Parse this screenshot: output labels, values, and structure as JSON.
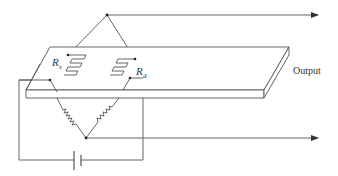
{
  "diagram": {
    "labels": {
      "rs_main": "R",
      "rs_sub": "s",
      "rd_main": "R",
      "rd_sub": "d",
      "output": "Output"
    },
    "components": [
      {
        "id": "Rs",
        "type": "strain-gauge",
        "label": "Rs"
      },
      {
        "id": "Rd",
        "type": "strain-gauge",
        "label": "Rd"
      },
      {
        "id": "R1",
        "type": "resistor",
        "label": ""
      },
      {
        "id": "R2",
        "type": "resistor",
        "label": ""
      },
      {
        "id": "battery",
        "type": "battery",
        "label": ""
      },
      {
        "id": "plate",
        "type": "beam",
        "label": "Output"
      }
    ],
    "colors": {
      "line": "#555555",
      "text": "#333333",
      "background": "#ffffff"
    }
  }
}
